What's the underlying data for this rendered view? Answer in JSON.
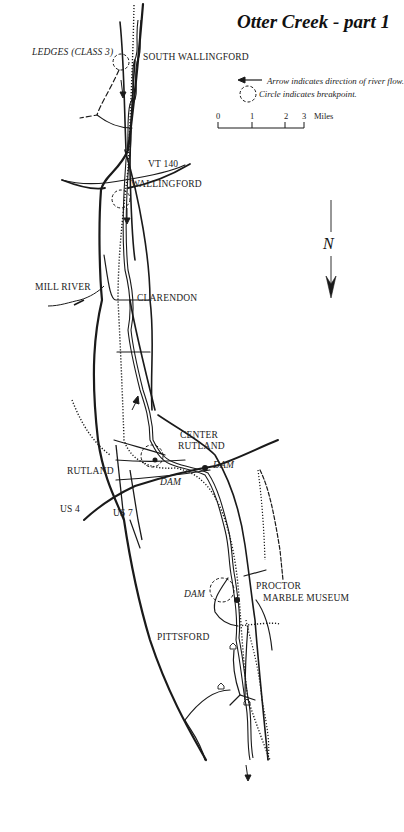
{
  "title": "Otter Creek - part 1",
  "legend": {
    "arrow_text": "Arrow indicates direction of river flow.",
    "circle_text": "Circle indicates breakpoint."
  },
  "scale": {
    "ticks": [
      "0",
      "1",
      "2",
      "3"
    ],
    "unit": "Miles"
  },
  "north_arrow": {
    "label": "N"
  },
  "places": {
    "ledges": "LEDGES (CLASS 3)",
    "south_wallingford": "SOUTH WALLINGFORD",
    "vt140": "VT 140",
    "wallingford": "WALLINGFORD",
    "mill_river": "MILL RIVER",
    "clarendon": "CLARENDON",
    "center_rutland_1": "CENTER",
    "center_rutland_2": "RUTLAND",
    "rutland": "RUTLAND",
    "dam_center": "DAM",
    "dam_rutland": "DAM",
    "us4": "US 4",
    "us7": "US 7",
    "dam_proctor": "DAM",
    "proctor": "PROCTOR",
    "marble_museum": "MARBLE MUSEUM",
    "pittsford": "PITTSFORD"
  },
  "colors": {
    "ink": "#1a1a1a",
    "paper": "#ffffff"
  }
}
